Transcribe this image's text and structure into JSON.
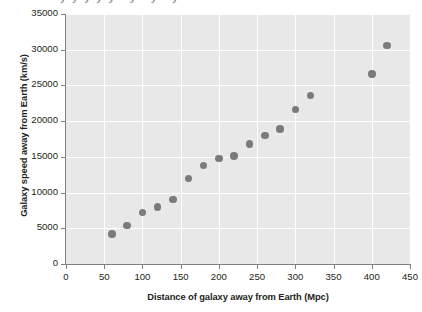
{
  "chart_data": {
    "type": "scatter",
    "title": "",
    "xlabel": "Distance of galaxy away from Earth (Mpc)",
    "ylabel": "Galaxy speed away from Earth (km/s)",
    "xlim": [
      0,
      450
    ],
    "ylim": [
      0,
      35000
    ],
    "xticks": [
      0,
      50,
      100,
      150,
      200,
      250,
      300,
      350,
      400,
      450
    ],
    "yticks": [
      0,
      5000,
      10000,
      15000,
      20000,
      25000,
      30000,
      35000
    ],
    "xtick_labels": [
      "0",
      "50",
      "100",
      "150",
      "200",
      "250",
      "300",
      "350",
      "400",
      "450"
    ],
    "ytick_labels": [
      "0",
      "5000",
      "10000",
      "15000",
      "20000",
      "25000",
      "30000",
      "35000"
    ],
    "grid": true,
    "grid_color": "#ffffff",
    "panel_color": "#e8e8e8",
    "legend": null,
    "marker_color": "#7b7b7b",
    "x": [
      60,
      80,
      100,
      120,
      140,
      160,
      180,
      200,
      220,
      240,
      260,
      280,
      300,
      320,
      400,
      420
    ],
    "y": [
      4200,
      5400,
      7200,
      7950,
      9000,
      12000,
      13800,
      14800,
      15100,
      16800,
      18000,
      18900,
      21600,
      23600,
      26600,
      30600
    ],
    "points": [
      {
        "x": 60,
        "y": 4200
      },
      {
        "x": 80,
        "y": 5400
      },
      {
        "x": 100,
        "y": 7200
      },
      {
        "x": 120,
        "y": 7950
      },
      {
        "x": 140,
        "y": 9000
      },
      {
        "x": 160,
        "y": 12000
      },
      {
        "x": 180,
        "y": 13800
      },
      {
        "x": 200,
        "y": 14800
      },
      {
        "x": 220,
        "y": 15100
      },
      {
        "x": 240,
        "y": 16800
      },
      {
        "x": 260,
        "y": 18000
      },
      {
        "x": 280,
        "y": 18900
      },
      {
        "x": 300,
        "y": 21600
      },
      {
        "x": 320,
        "y": 23600
      },
      {
        "x": 400,
        "y": 26600
      },
      {
        "x": 420,
        "y": 30600
      }
    ]
  },
  "top_partial_text": "yyyyy   y   y     y"
}
